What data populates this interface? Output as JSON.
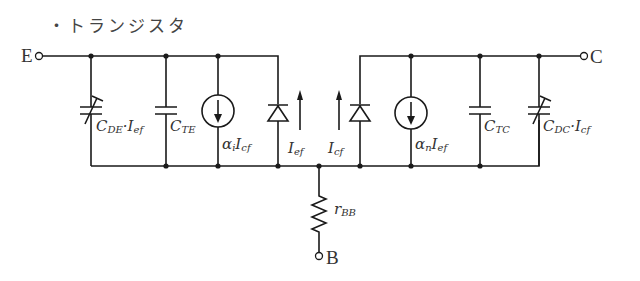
{
  "title": "・トランジスタ",
  "terminals": {
    "emitter": "E",
    "collector": "C",
    "base": "B"
  },
  "components": {
    "c_de": {
      "main": "C",
      "sub": "DE",
      "mid": "·I",
      "sub2": "ef"
    },
    "c_te": {
      "main": "C",
      "sub": "TE"
    },
    "src_i": {
      "main": "α",
      "sub": "i",
      "mid": "I",
      "sub2": "cf"
    },
    "i_ef": {
      "main": "I",
      "sub": "ef"
    },
    "i_cf": {
      "main": "I",
      "sub": "cf"
    },
    "src_n": {
      "main": "α",
      "sub": "n",
      "mid": "I",
      "sub2": "ef"
    },
    "c_tc": {
      "main": "C",
      "sub": "TC"
    },
    "c_dc": {
      "main": "C",
      "sub": "DC",
      "mid": "·I",
      "sub2": "cf"
    },
    "r_bb": {
      "main": "r",
      "sub": "BB"
    }
  },
  "colors": {
    "line": "#1a1a1a",
    "text": "#333333",
    "background": "#ffffff"
  }
}
